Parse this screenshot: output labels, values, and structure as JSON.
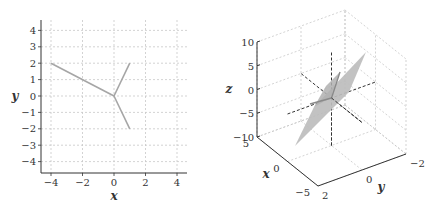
{
  "chart_data": [
    {
      "type": "line",
      "title": "",
      "xlabel": "x",
      "ylabel": "y",
      "xlim": [
        -4.6,
        4.6
      ],
      "ylim": [
        -4.6,
        4.6
      ],
      "xticks": [
        -4,
        -2,
        0,
        2,
        4
      ],
      "yticks": [
        -4,
        -3,
        -2,
        -1,
        0,
        1,
        2,
        3,
        4
      ],
      "xtick_labels": [
        "−4",
        "−2",
        "0",
        "2",
        "4"
      ],
      "ytick_labels": [
        "−4",
        "−3",
        "−2",
        "−1",
        "0",
        "1",
        "2",
        "3",
        "4"
      ],
      "grid": true,
      "series": [
        {
          "name": "vector-1",
          "x": [
            0,
            -4
          ],
          "y": [
            0,
            2
          ]
        },
        {
          "name": "vector-2",
          "x": [
            0,
            1
          ],
          "y": [
            0,
            2
          ]
        },
        {
          "name": "vector-3",
          "x": [
            0,
            1
          ],
          "y": [
            0,
            -2
          ]
        }
      ],
      "line_color": "#a6a6a6"
    },
    {
      "type": "surface3d",
      "title": "",
      "xlabel": "x",
      "ylabel": "y",
      "zlabel": "z",
      "xlim": [
        -5,
        5
      ],
      "ylim": [
        -2,
        2
      ],
      "zlim": [
        -10,
        10
      ],
      "xticks": [
        -5,
        0,
        5
      ],
      "yticks": [
        -2,
        0,
        2
      ],
      "zticks": [
        -10,
        -5,
        0,
        5,
        10
      ],
      "xtick_labels": [
        "−5",
        "0",
        "5"
      ],
      "ytick_labels": [
        "−2",
        "0",
        "2"
      ],
      "ztick_labels": [
        "−10",
        "−5",
        "0",
        "5",
        "10"
      ],
      "grid": true,
      "elements": [
        {
          "name": "plane",
          "kind": "parallelogram",
          "color": "#bdbdbd"
        },
        {
          "name": "coordinate-axes",
          "kind": "dashed-lines",
          "color": "#333333"
        },
        {
          "name": "vector-lines-in-plane",
          "kind": "lines",
          "color": "#8a8a8a"
        }
      ]
    }
  ]
}
